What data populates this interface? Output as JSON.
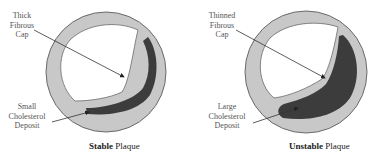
{
  "diagram": {
    "panels": [
      {
        "id": "stable",
        "top_label": [
          "Thick",
          "Fibrous",
          "Cap"
        ],
        "bottom_label": [
          "Small",
          "Cholesterol",
          "Deposit"
        ],
        "caption_bold": "Stable",
        "caption_rest": " Plaque"
      },
      {
        "id": "unstable",
        "top_label": [
          "Thinned",
          "Fibrous",
          "Cap"
        ],
        "bottom_label": [
          "Large",
          "Cholesterol",
          "Deposit"
        ],
        "caption_bold": "Unstable",
        "caption_rest": " Plaque"
      }
    ],
    "colors": {
      "vessel_wall": "#c8c8c8",
      "vessel_outline": "#6a6a6a",
      "lumen": "#ffffff",
      "cholesterol": "#3c3c3c",
      "arrow": "#333333"
    }
  }
}
